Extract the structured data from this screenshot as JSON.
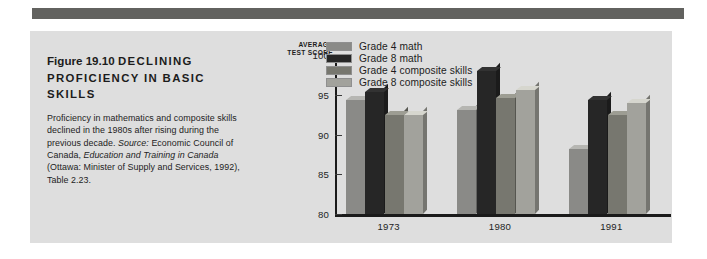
{
  "figure": {
    "number": "Figure 19.10",
    "headline": "DECLINING PROFICIENCY IN BASIC SKILLS",
    "caption_plain": "Proficiency in mathematics and composite skills declined in the 1980s after rising during the previous decade. Source: Economic Council of Canada, Education and Training in Canada (Ottawa: Minister of Supply and Services, 1992), Table 2.23.",
    "caption_part1": "Proficiency in mathematics and composite skills declined in the 1980s after rising during the previous decade. ",
    "caption_source_label": "Source:",
    "caption_part2": " Economic Council of Canada, ",
    "caption_italic_title": "Education and Training in Canada",
    "caption_part3": " (Ottawa: Minister of Supply and Services, 1992), Table 2.23."
  },
  "chart_data": {
    "type": "bar",
    "title": "DECLINING PROFICIENCY IN BASIC SKILLS",
    "xlabel": "",
    "ylabel": "AVERAGE TEST SCORE",
    "ylabel_line1": "AVERAGE",
    "ylabel_line2": "TEST SCORE",
    "categories": [
      "1973",
      "1980",
      "1991"
    ],
    "ylim": [
      80,
      100
    ],
    "yticks": [
      80,
      85,
      90,
      95,
      100
    ],
    "grid": false,
    "legend_position": "top-left-inside",
    "series": [
      {
        "name": "Grade 4 math",
        "color": "#8a8a87",
        "values": [
          94.4,
          93.1,
          88.2
        ]
      },
      {
        "name": "Grade 8 math",
        "color": "#262626",
        "values": [
          95.4,
          98.0,
          94.3
        ]
      },
      {
        "name": "Grade 4 composite skills",
        "color": "#77776f",
        "values": [
          92.4,
          94.6,
          92.5
        ]
      },
      {
        "name": "Grade 8 composite skills",
        "color": "#a2a29c",
        "values": [
          92.5,
          95.6,
          94.0
        ]
      }
    ]
  },
  "colors": {
    "banner": "#62625f",
    "panel": "#dedede",
    "axis": "#1a1a1a",
    "text": "#1c1c1c"
  }
}
